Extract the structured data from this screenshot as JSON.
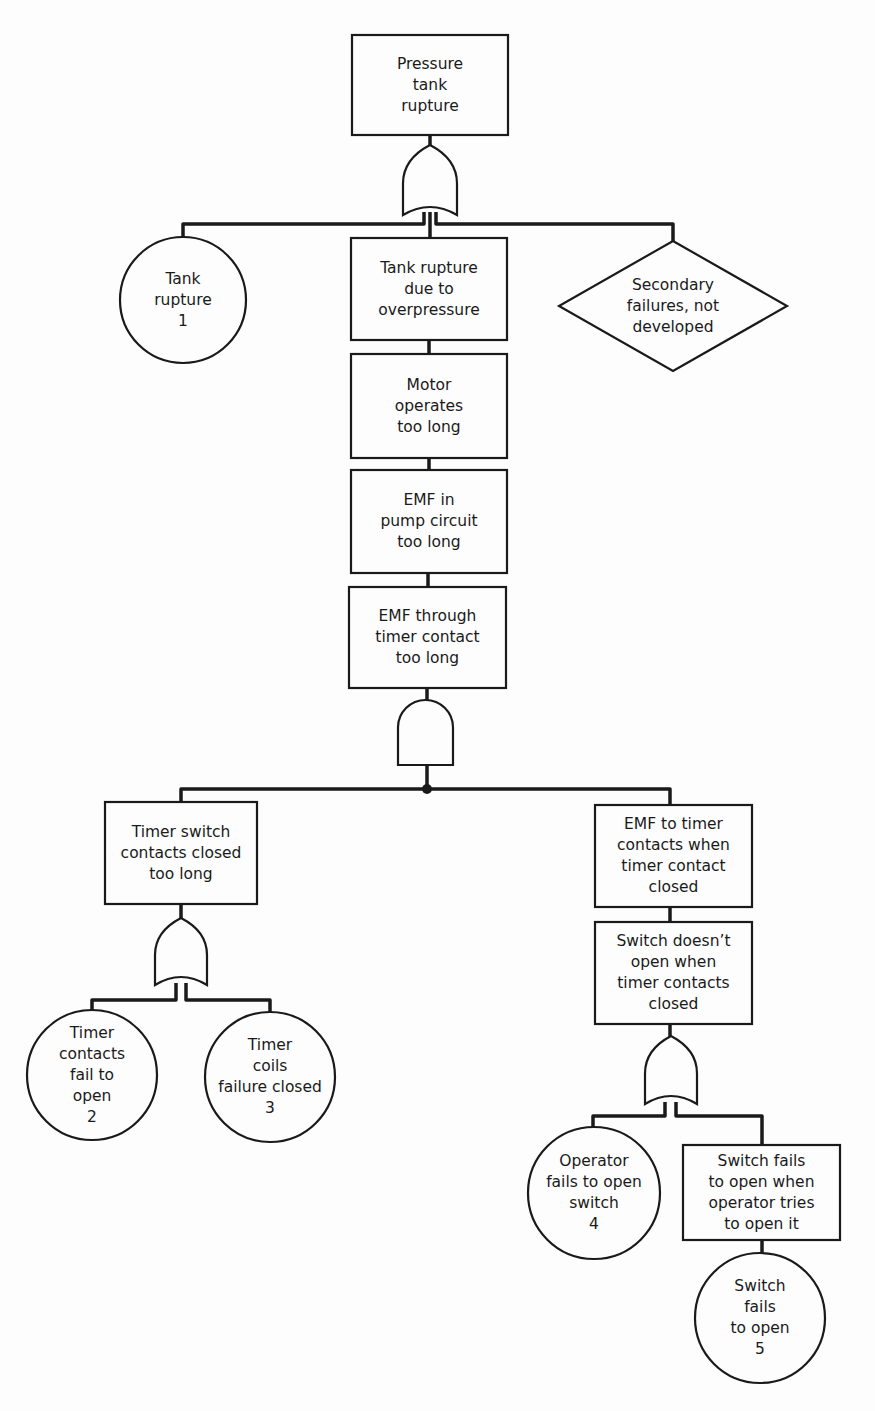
{
  "diagram": {
    "type": "fault-tree",
    "nodes": [
      {
        "id": "top",
        "shape": "rect",
        "label": "Pressure\ntank\nrupture",
        "x": 352,
        "y": 35,
        "w": 156,
        "h": 100
      },
      {
        "id": "e1",
        "shape": "circle",
        "label": "Tank\nrupture\n1",
        "cx": 183,
        "cy": 300,
        "r": 63
      },
      {
        "id": "b1",
        "shape": "rect",
        "label": "Tank rupture\ndue to\noverpressure",
        "x": 351,
        "y": 238,
        "w": 156,
        "h": 102
      },
      {
        "id": "d1",
        "shape": "diamond",
        "label": "Secondary\nfailures, not\ndeveloped",
        "cx": 673,
        "cy": 306,
        "hw": 114,
        "hh": 65
      },
      {
        "id": "b2",
        "shape": "rect",
        "label": "Motor\noperates\ntoo long",
        "x": 351,
        "y": 354,
        "w": 156,
        "h": 104
      },
      {
        "id": "b3",
        "shape": "rect",
        "label": "EMF in\npump circuit\ntoo long",
        "x": 351,
        "y": 470,
        "w": 156,
        "h": 103
      },
      {
        "id": "b4",
        "shape": "rect",
        "label": "EMF through\ntimer contact\ntoo long",
        "x": 349,
        "y": 587,
        "w": 157,
        "h": 101
      },
      {
        "id": "b5",
        "shape": "rect",
        "label": "Timer switch\ncontacts closed\ntoo long",
        "x": 105,
        "y": 802,
        "w": 152,
        "h": 102
      },
      {
        "id": "b6",
        "shape": "rect",
        "label": "EMF to timer\ncontacts when\ntimer contact\nclosed",
        "x": 595,
        "y": 805,
        "w": 157,
        "h": 102
      },
      {
        "id": "b7",
        "shape": "rect",
        "label": "Switch doesn’t\nopen when\ntimer contacts\nclosed",
        "x": 595,
        "y": 922,
        "w": 157,
        "h": 102
      },
      {
        "id": "e2",
        "shape": "circle",
        "label": "Timer\ncontacts\nfail to\nopen\n2",
        "cx": 92,
        "cy": 1075,
        "r": 65
      },
      {
        "id": "e3",
        "shape": "circle",
        "label": "Timer\ncoils\nfailure closed\n3",
        "cx": 270,
        "cy": 1077,
        "r": 65
      },
      {
        "id": "e4",
        "shape": "circle",
        "label": "Operator\nfails to open\nswitch\n4",
        "cx": 594,
        "cy": 1193,
        "r": 66
      },
      {
        "id": "b8",
        "shape": "rect",
        "label": "Switch fails\nto open when\noperator tries\nto open it",
        "x": 683,
        "y": 1145,
        "w": 157,
        "h": 95
      },
      {
        "id": "e5",
        "shape": "circle",
        "label": "Switch\nfails\nto open\n5",
        "cx": 760,
        "cy": 1318,
        "r": 65
      }
    ],
    "gates": [
      {
        "id": "g1",
        "type": "or",
        "x": 403,
        "y": 145,
        "w": 54,
        "h": 70
      },
      {
        "id": "g2",
        "type": "and",
        "x": 398,
        "y": 700,
        "w": 55,
        "h": 65
      },
      {
        "id": "g3",
        "type": "or",
        "x": 155,
        "y": 918,
        "w": 52,
        "h": 67
      },
      {
        "id": "g4",
        "type": "or",
        "x": 645,
        "y": 1036,
        "w": 52,
        "h": 68
      }
    ],
    "junction_dot": {
      "cx": 427,
      "cy": 789,
      "r": 5
    },
    "line_color": "#1a1a1a"
  }
}
